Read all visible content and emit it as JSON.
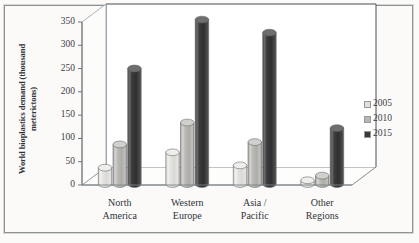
{
  "chart_data": {
    "type": "bar",
    "title": "",
    "xlabel": "",
    "ylabel": "World bioplastics demand (thousand meterictons)",
    "categories": [
      "North America",
      "Western Europe",
      "Asia / Pacific",
      "Other Regions"
    ],
    "category_lines": [
      [
        "North",
        "America"
      ],
      [
        "Western",
        "Europe"
      ],
      [
        "Asia /",
        "Pacific"
      ],
      [
        "Other",
        "Regions"
      ]
    ],
    "series": [
      {
        "name": "2005",
        "color": "#e2e0dc",
        "values": [
          35,
          68,
          40,
          8
        ]
      },
      {
        "name": "2010",
        "color": "#b9b7b3",
        "values": [
          85,
          132,
          90,
          18
        ]
      },
      {
        "name": "2015",
        "color": "#3a3a3a",
        "values": [
          248,
          353,
          325,
          120
        ]
      }
    ],
    "ylim": [
      0,
      350
    ],
    "yticks": [
      0,
      50,
      100,
      150,
      200,
      250,
      300,
      350
    ],
    "ytick_labels": [
      "0",
      "50",
      "100",
      "150",
      "200",
      "250",
      "300",
      "350"
    ],
    "grid": false,
    "legend_position": "right",
    "style": "3d-cylinder"
  },
  "colors": {
    "background": "#fbfaf8",
    "frame": "#8d9296",
    "axis": "#6f7479",
    "text": "#2f343a"
  }
}
